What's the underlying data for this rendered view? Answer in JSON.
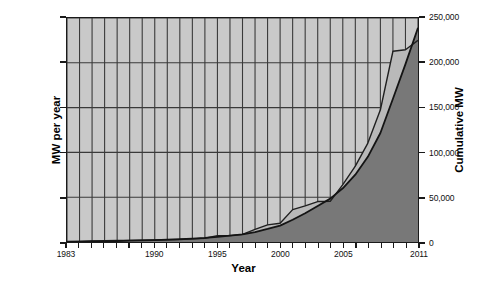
{
  "chart_data": {
    "type": "area",
    "title": "",
    "xlabel": "Year",
    "ylabel": "MW per year",
    "ylabel_secondary": "Cumulative MW",
    "grid": true,
    "legend_position": "none",
    "xlim": [
      1983,
      2011
    ],
    "ylim": [
      0,
      45000
    ],
    "ylim_secondary": [
      0,
      250000
    ],
    "xticks": [
      "1983",
      "1990",
      "1995",
      "2000",
      "2005",
      "2011"
    ],
    "xtick_values": [
      1983,
      1990,
      1995,
      2000,
      2005,
      2011
    ],
    "yticks_left": [
      "0",
      "9,000",
      "18,000",
      "27,000",
      "36,000",
      "45,000"
    ],
    "ytick_left_values": [
      0,
      9000,
      18000,
      27000,
      36000,
      45000
    ],
    "yticks_right": [
      "0",
      "50,000",
      "100,000",
      "150,000",
      "200,000",
      "250,000"
    ],
    "ytick_right_values": [
      0,
      50000,
      100000,
      150000,
      200000,
      250000
    ],
    "x": [
      1983,
      1984,
      1985,
      1986,
      1987,
      1988,
      1989,
      1990,
      1991,
      1992,
      1993,
      1994,
      1995,
      1996,
      1997,
      1998,
      1999,
      2000,
      2001,
      2002,
      2003,
      2004,
      2005,
      2006,
      2007,
      2008,
      2009,
      2010,
      2011
    ],
    "series": [
      {
        "name": "MW per year",
        "axis": "left",
        "values": [
          90,
          130,
          200,
          260,
          300,
          330,
          360,
          390,
          440,
          500,
          620,
          760,
          1290,
          1290,
          1530,
          2520,
          3440,
          3770,
          6500,
          7270,
          8130,
          8160,
          11540,
          15240,
          19870,
          26560,
          38320,
          38610,
          40500
        ]
      },
      {
        "name": "Cumulative MW",
        "axis": "right",
        "values": [
          210,
          340,
          540,
          800,
          1100,
          1430,
          1790,
          2180,
          2620,
          3120,
          3740,
          4500,
          5790,
          7080,
          8610,
          11130,
          14570,
          18340,
          24840,
          32110,
          40240,
          48400,
          59940,
          75180,
          95050,
          121610,
          159930,
          198540,
          239000
        ]
      }
    ]
  }
}
